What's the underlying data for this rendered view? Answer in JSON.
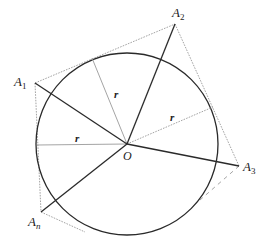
{
  "diagram": {
    "center": {
      "label": "O",
      "x": 127,
      "y": 144
    },
    "circle": {
      "cx": 127,
      "cy": 144,
      "r": 91,
      "stroke": "#2a2a2a"
    },
    "vertices": [
      {
        "id": "A1",
        "base": "A",
        "sub": "1",
        "x": 35,
        "y": 83,
        "label_x": 14,
        "label_y": 85
      },
      {
        "id": "A2",
        "base": "A",
        "sub": "2",
        "x": 175,
        "y": 24,
        "label_x": 172,
        "label_y": 18
      },
      {
        "id": "A3",
        "base": "A",
        "sub": "3",
        "x": 239,
        "y": 166,
        "label_x": 243,
        "label_y": 171
      },
      {
        "id": "An",
        "base": "A",
        "sub": "n",
        "x": 41,
        "y": 212,
        "label_x": 28,
        "label_y": 227
      }
    ],
    "radius_segments": [
      {
        "label": "r",
        "from": "O",
        "to": [
          92,
          58
        ],
        "label_x": 114,
        "label_y": 97
      },
      {
        "label": "r",
        "from": "O",
        "to": [
          213,
          107
        ],
        "label_x": 170,
        "label_y": 120
      },
      {
        "label": "r",
        "from": "O",
        "to": [
          37,
          145
        ],
        "label_x": 75,
        "label_y": 141
      }
    ],
    "polygon_edges_style": "dotted",
    "polygon_color": "#9a9a9a",
    "spoke_color": "#2a2a2a",
    "radius_color": "#9a9a9a",
    "labels": {
      "O": "O",
      "r": "r",
      "A": "A",
      "sub1": "1",
      "sub2": "2",
      "sub3": "3",
      "subn": "n"
    }
  }
}
